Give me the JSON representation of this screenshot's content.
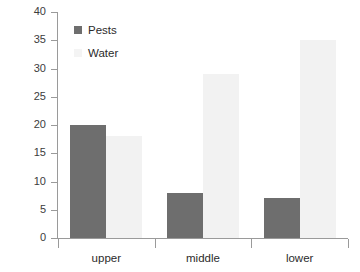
{
  "chart_data": {
    "type": "bar",
    "title": "",
    "xlabel": "",
    "ylabel": "",
    "categories": [
      "upper",
      "middle",
      "lower"
    ],
    "series": [
      {
        "name": "Pests",
        "color": "#6e6e6e",
        "values": [
          20,
          8,
          7
        ]
      },
      {
        "name": "Water",
        "color": "#f2f2f2",
        "values": [
          18,
          29,
          35
        ]
      }
    ],
    "ylim": [
      0,
      40
    ],
    "ytick_step": 5,
    "yticks": [
      0,
      5,
      10,
      15,
      20,
      25,
      30,
      35,
      40
    ],
    "ytick_labels": [
      "0",
      "5",
      "10",
      "15",
      "20",
      "25",
      "30",
      "35",
      "40"
    ],
    "grid": false,
    "legend_position": "top-left",
    "axis_color": "#9a9a9a",
    "text_color": "#2b2b2b",
    "background": "#ffffff"
  },
  "legend": {
    "entries": [
      {
        "label": "Pests"
      },
      {
        "label": "Water"
      }
    ]
  }
}
